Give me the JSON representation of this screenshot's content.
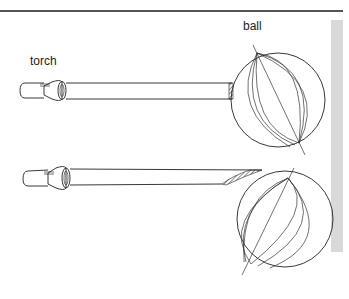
{
  "labels": {
    "torch": "torch",
    "ball": "ball"
  },
  "colors": {
    "line": "#222222",
    "rule": "#555555",
    "side_bar": "#d9d9d9",
    "background": "#ffffff"
  },
  "figures": [
    {
      "id": "top",
      "description": "torch beam hitting ball side-on, small lit patch"
    },
    {
      "id": "bottom",
      "description": "torch beam hitting ball at an angle, larger lit patch"
    }
  ]
}
